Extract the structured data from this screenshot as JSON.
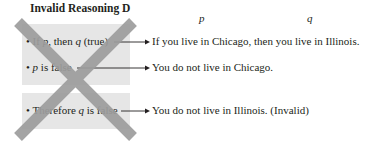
{
  "title": "Invalid Reasoning D",
  "variable_labels": {
    "p": "p",
    "q": "q"
  },
  "statements": [
    {
      "bullet": "•",
      "parts": [
        "If ",
        "p",
        ", then ",
        "q",
        " (true)"
      ],
      "example": "If you live in Chicago, then you live in Illinois."
    },
    {
      "bullet": "•",
      "parts": [
        "",
        "p",
        " is false"
      ],
      "example": "You do not live in Chicago."
    },
    {
      "bullet": "•",
      "parts": [
        "Therefore ",
        "q",
        " is false"
      ],
      "example": "You do not live in Illinois. (Invalid)"
    }
  ],
  "colors": {
    "box": "#e6e6e6",
    "cross": "#9d9d9d",
    "text": "#231f20"
  }
}
